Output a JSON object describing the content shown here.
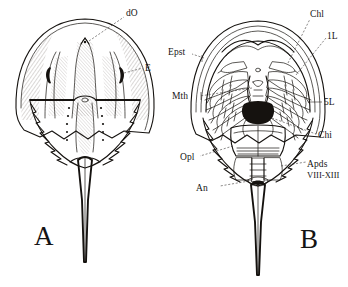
{
  "plate": {
    "background_color": "#ffffff",
    "ink_color": "#15120f",
    "subject": "horseshoe-crab-limulus",
    "panels": [
      {
        "id": "A",
        "letter": "A",
        "view": "dorsal",
        "labels": [
          {
            "key": "dO",
            "text": "dO",
            "meaning": "dorsal-ocellus"
          },
          {
            "key": "E",
            "text": "E",
            "meaning": "compound-eye"
          }
        ]
      },
      {
        "id": "B",
        "letter": "B",
        "view": "ventral",
        "labels": [
          {
            "key": "Chl",
            "text": "Chl",
            "meaning": "chelicera"
          },
          {
            "key": "1L",
            "text": "1L",
            "meaning": "first-leg"
          },
          {
            "key": "Epst",
            "text": "Epst",
            "meaning": "epistome"
          },
          {
            "key": "Mth",
            "text": "Mth",
            "meaning": "mouth"
          },
          {
            "key": "5L",
            "text": "5L",
            "meaning": "fifth-leg"
          },
          {
            "key": "Chi",
            "text": "Chi",
            "meaning": "chilaria"
          },
          {
            "key": "Opl",
            "text": "Opl",
            "meaning": "operculum"
          },
          {
            "key": "An",
            "text": "An",
            "meaning": "anus"
          },
          {
            "key": "Apds",
            "text": "Apds",
            "meaning": "appendages"
          },
          {
            "key": "Apds_range",
            "text": "VIII-XIII",
            "meaning": "appendage-segment-range"
          }
        ]
      }
    ]
  }
}
